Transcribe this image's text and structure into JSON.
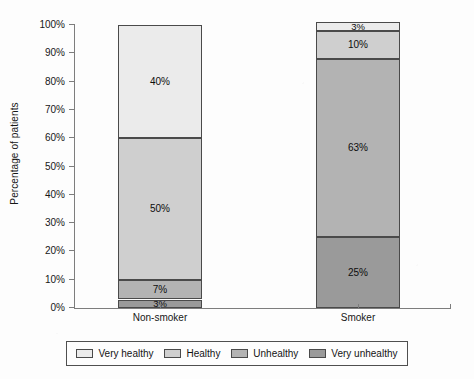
{
  "chart_data": {
    "type": "bar",
    "subtype": "stacked-bar-100",
    "title": "",
    "xlabel": "",
    "ylabel": "Percentage of patients",
    "categories": [
      "Non-smoker",
      "Smoker"
    ],
    "ylim": [
      0,
      100
    ],
    "ytick_labels": [
      "0%",
      "10%",
      "20%",
      "30%",
      "40%",
      "50%",
      "60%",
      "70%",
      "80%",
      "90%",
      "100%"
    ],
    "ytick_values": [
      0,
      10,
      20,
      30,
      40,
      50,
      60,
      70,
      80,
      90,
      100
    ],
    "grid": false,
    "legend_position": "bottom",
    "series": [
      {
        "name": "Very healthy",
        "color": "#ebebeb",
        "values": [
          40,
          3
        ],
        "labels": [
          "40%",
          "3%"
        ]
      },
      {
        "name": "Healthy",
        "color": "#cfcfcf",
        "values": [
          50,
          10
        ],
        "labels": [
          "50%",
          "10%"
        ]
      },
      {
        "name": "Unhealthy",
        "color": "#b3b3b3",
        "values": [
          7,
          63
        ],
        "labels": [
          "7%",
          "63%"
        ]
      },
      {
        "name": "Very unhealthy",
        "color": "#9a9a9a",
        "values": [
          3,
          25
        ],
        "labels": [
          "3%",
          "25%"
        ]
      }
    ],
    "column_totals": [
      100,
      101
    ]
  },
  "legend": {
    "items": [
      {
        "label": "Very healthy"
      },
      {
        "label": "Healthy"
      },
      {
        "label": "Unhealthy"
      },
      {
        "label": "Very unhealthy"
      }
    ]
  },
  "axis": {
    "y_title": "Percentage of patients"
  }
}
